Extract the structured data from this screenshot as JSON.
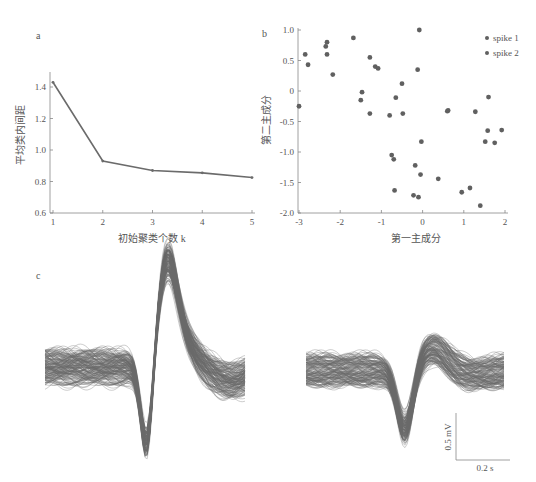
{
  "panels": {
    "a": {
      "label": "a"
    },
    "b": {
      "label": "b"
    },
    "c": {
      "label": "c"
    }
  },
  "colors": {
    "line": "#6b6b6b",
    "point": "#606060",
    "axis": "#888888",
    "waveform": "#5a5a5a"
  },
  "chart_data": [
    {
      "panel": "a",
      "type": "line",
      "title": "",
      "xlabel": "初始聚类个数 k",
      "ylabel": "平均类内间距",
      "x": [
        1,
        2,
        3,
        4,
        5
      ],
      "values": [
        1.43,
        0.93,
        0.87,
        0.855,
        0.825
      ],
      "xticks": [
        "1",
        "2",
        "3",
        "4",
        "5"
      ],
      "yticks": [
        "0.6",
        "0.8",
        "1.0",
        "1.2",
        "1.4"
      ],
      "xlim": [
        1,
        5
      ],
      "ylim": [
        0.6,
        1.5
      ],
      "grid": false
    },
    {
      "panel": "b",
      "type": "scatter",
      "title": "",
      "xlabel": "第一主成分",
      "ylabel": "第二主成分",
      "xticks": [
        "-3",
        "-2",
        "-1",
        "0",
        "1",
        "2"
      ],
      "yticks": [
        "1.0",
        "0.5",
        "0",
        "-0.5",
        "-1.0",
        "-1.5",
        "-2.0"
      ],
      "xlim": [
        -3,
        2
      ],
      "ylim": [
        -2.0,
        1.0
      ],
      "grid": false,
      "legend": {
        "position": "top-right",
        "entries": [
          "spike 1",
          "spike 2"
        ]
      },
      "series": [
        {
          "name": "spike 1",
          "points": [
            [
              -3.0,
              -0.25
            ],
            [
              -2.85,
              0.6
            ],
            [
              -2.78,
              0.43
            ],
            [
              -2.35,
              0.73
            ],
            [
              -2.32,
              0.8
            ],
            [
              -2.32,
              0.6
            ],
            [
              -2.18,
              0.27
            ],
            [
              -1.68,
              0.87
            ],
            [
              -1.5,
              -0.15
            ],
            [
              -1.47,
              -0.02
            ],
            [
              -1.28,
              0.55
            ],
            [
              -1.28,
              -0.37
            ],
            [
              -1.15,
              0.4
            ],
            [
              -1.08,
              0.37
            ],
            [
              -0.8,
              -0.4
            ],
            [
              -0.65,
              -0.11
            ],
            [
              -0.5,
              0.12
            ],
            [
              -0.48,
              -0.37
            ],
            [
              -0.12,
              0.35
            ],
            [
              -0.08,
              1.0
            ]
          ]
        },
        {
          "name": "spike 2",
          "points": [
            [
              -0.75,
              -1.05
            ],
            [
              -0.7,
              -1.12
            ],
            [
              -0.68,
              -1.63
            ],
            [
              -0.03,
              -0.83
            ],
            [
              -0.18,
              -1.22
            ],
            [
              -0.05,
              -1.37
            ],
            [
              -0.22,
              -1.71
            ],
            [
              -0.1,
              -1.74
            ],
            [
              0.38,
              -1.44
            ],
            [
              0.6,
              -0.33
            ],
            [
              0.62,
              -0.32
            ],
            [
              0.95,
              -1.66
            ],
            [
              1.15,
              -1.59
            ],
            [
              1.28,
              -0.34
            ],
            [
              1.4,
              -1.88
            ],
            [
              1.6,
              -0.1
            ],
            [
              1.58,
              -0.65
            ],
            [
              1.52,
              -0.83
            ],
            [
              1.75,
              -0.85
            ],
            [
              1.92,
              -0.64
            ]
          ]
        }
      ]
    },
    {
      "panel": "c",
      "type": "line",
      "title": "",
      "description": "Overlaid spike waveforms: left = spike 1 (large biphasic), right = spike 2 (smaller negative spike)",
      "scalebar": {
        "vertical": "0.5 mV",
        "horizontal": "0.2 s"
      }
    }
  ]
}
